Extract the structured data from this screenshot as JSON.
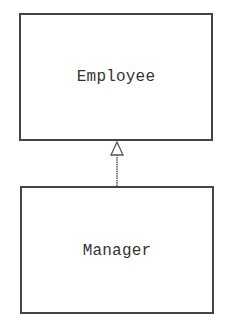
{
  "diagram": {
    "type": "uml-class-inheritance",
    "classes": [
      {
        "id": "employee",
        "name": "Employee",
        "role": "superclass"
      },
      {
        "id": "manager",
        "name": "Manager",
        "role": "subclass"
      }
    ],
    "relationships": [
      {
        "from": "Manager",
        "to": "Employee",
        "type": "generalization",
        "arrowhead": "hollow-triangle"
      }
    ],
    "colors": {
      "border": "#444444",
      "text": "#333333",
      "background": "#ffffff"
    }
  }
}
